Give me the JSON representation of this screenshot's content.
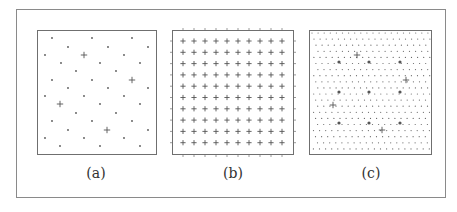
{
  "figure": {
    "colors": {
      "frame": "#6f6f6f",
      "outer_border": "#8a8a8a",
      "mark": "#555555",
      "dot": "#666666",
      "caption": "#333333"
    },
    "panels": [
      {
        "id": "a",
        "label": "(a)",
        "label_x": 96,
        "frame": {
          "x": 37,
          "y": 30,
          "w": 119,
          "h": 124
        },
        "description": "sparse triangular lattice of dots with a sparser lattice of plus marks",
        "dots": [
          [
            52,
            38
          ],
          [
            92,
            38
          ],
          [
            132,
            38
          ],
          [
            68,
            47
          ],
          [
            108,
            47
          ],
          [
            148,
            47
          ],
          [
            45,
            55
          ],
          [
            124,
            55
          ],
          [
            61,
            63
          ],
          [
            100,
            63
          ],
          [
            140,
            63
          ],
          [
            76,
            71
          ],
          [
            116,
            71
          ],
          [
            52,
            80
          ],
          [
            92,
            80
          ],
          [
            68,
            88
          ],
          [
            108,
            88
          ],
          [
            148,
            88
          ],
          [
            45,
            96
          ],
          [
            84,
            96
          ],
          [
            124,
            96
          ],
          [
            100,
            104
          ],
          [
            140,
            104
          ],
          [
            76,
            113
          ],
          [
            116,
            113
          ],
          [
            52,
            121
          ],
          [
            92,
            121
          ],
          [
            132,
            121
          ],
          [
            68,
            130
          ],
          [
            148,
            130
          ],
          [
            45,
            138
          ],
          [
            84,
            138
          ],
          [
            124,
            138
          ],
          [
            60,
            146
          ],
          [
            100,
            146
          ],
          [
            140,
            146
          ]
        ],
        "plus_marks": [
          [
            84,
            55
          ],
          [
            132,
            80
          ],
          [
            60,
            104
          ],
          [
            107,
            130
          ]
        ]
      },
      {
        "id": "b",
        "label": "(b)",
        "label_x": 233,
        "frame": {
          "x": 172,
          "y": 30,
          "w": 121,
          "h": 124
        },
        "description": "regular 10x10 square grid of plus marks with edge ticks",
        "grid": {
          "cols": 10,
          "rows": 10,
          "x0": 183,
          "y0": 41,
          "dx": 11,
          "dy": 11.3
        }
      },
      {
        "id": "c",
        "label": "(c)",
        "label_x": 371,
        "frame": {
          "x": 309,
          "y": 30,
          "w": 122,
          "h": 124
        },
        "description": "dense slanted lattice of small dots with a 3x3 grid of larger dots and four plus marks",
        "dense_lattice": {
          "dx": 6.1,
          "dy": 6.1,
          "row_shift": 2.0
        },
        "large_dots": [
          [
            339,
            62
          ],
          [
            369,
            62
          ],
          [
            400,
            62
          ],
          [
            339,
            92
          ],
          [
            369,
            92
          ],
          [
            400,
            92
          ],
          [
            339,
            123
          ],
          [
            369,
            123
          ],
          [
            400,
            123
          ]
        ],
        "plus_marks": [
          [
            357,
            55
          ],
          [
            406,
            80
          ],
          [
            333,
            105
          ],
          [
            382,
            130
          ]
        ]
      }
    ]
  }
}
